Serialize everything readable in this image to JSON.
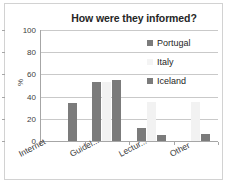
{
  "chart_data": {
    "type": "bar",
    "title": "How were they informed?",
    "xlabel": "",
    "ylabel": "%",
    "ylim": [
      0,
      100
    ],
    "ytick_labels": [
      "100",
      "80",
      "60",
      "40",
      "20",
      "0"
    ],
    "ytick_values": [
      100,
      80,
      60,
      40,
      20,
      0
    ],
    "grid": true,
    "legend_position": "top-right",
    "categories": [
      "Internet",
      "Guidel...",
      "Lectur...",
      "Other"
    ],
    "series": [
      {
        "name": "Portugal",
        "color": "#7b7b7b",
        "values": [
          0,
          53,
          12,
          0
        ]
      },
      {
        "name": "Italy",
        "color": "#f2f2f2",
        "values": [
          0,
          53,
          35,
          35
        ]
      },
      {
        "name": "Iceland",
        "color": "#7b7b7b",
        "values": [
          34,
          55,
          5,
          6
        ]
      }
    ]
  },
  "legend": {
    "entries": [
      {
        "label": "Portugal"
      },
      {
        "label": "Italy"
      },
      {
        "label": "Iceland"
      }
    ]
  }
}
